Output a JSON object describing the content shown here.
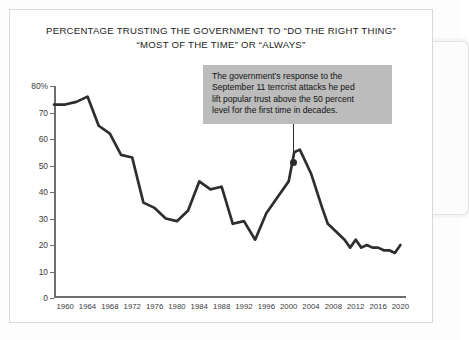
{
  "title": {
    "line1": "PERCENTAGE TRUSTING THE GOVERNMENT TO “DO THE RIGHT THING”",
    "line2": "“MOST OF THE TIME” OR “ALWAYS”"
  },
  "annotation": {
    "line1": "The government’s response to the",
    "line2": "September 11 terrcrist attacks he ped",
    "line3": "lift popular trust above the 50 percent",
    "line4": "level for the first time in decades."
  },
  "colors": {
    "line": "#2e2e2e",
    "axis": "#6e6e6e",
    "callout_bg": "#bcbcbc",
    "card_border": "#d8d8d8",
    "text": "#1d1d1d"
  },
  "chart_data": {
    "type": "line",
    "title": "PERCENTAGE TRUSTING THE GOVERNMENT TO “DO THE RIGHT THING” “MOST OF THE TIME” OR “ALWAYS”",
    "xlabel": "",
    "ylabel": "",
    "xlim": [
      1958,
      2021
    ],
    "ylim": [
      0,
      80
    ],
    "grid": false,
    "legend": "none",
    "ytick_labels": [
      "80%",
      "70",
      "60",
      "50",
      "40",
      "30",
      "20",
      "10",
      "0"
    ],
    "ytick_values": [
      80,
      70,
      60,
      50,
      40,
      30,
      20,
      10,
      0
    ],
    "xtick_labels": [
      "1960",
      "1964",
      "1968",
      "1972",
      "1976",
      "1980",
      "1984",
      "1988",
      "1992",
      "1996",
      "2000",
      "2004",
      "2008",
      "2012",
      "2016",
      "2020"
    ],
    "xtick_values": [
      1960,
      1964,
      1968,
      1972,
      1976,
      1980,
      1984,
      1988,
      1992,
      1996,
      2000,
      2004,
      2008,
      2012,
      2016,
      2020
    ],
    "series": [
      {
        "name": "Trust in government",
        "x": [
          1958,
          1960,
          1962,
          1964,
          1966,
          1968,
          1970,
          1972,
          1974,
          1976,
          1978,
          1980,
          1982,
          1984,
          1986,
          1988,
          1990,
          1992,
          1994,
          1996,
          1998,
          2000,
          2001,
          2002,
          2004,
          2006,
          2007,
          2008,
          2010,
          2011,
          2012,
          2013,
          2014,
          2015,
          2016,
          2017,
          2018,
          2019,
          2020
        ],
        "y": [
          73,
          73,
          74,
          76,
          65,
          62,
          54,
          53,
          36,
          34,
          30,
          29,
          33,
          44,
          41,
          42,
          28,
          29,
          22,
          32,
          38,
          44,
          55,
          56,
          47,
          34,
          28,
          26,
          22,
          19,
          22,
          19,
          20,
          19,
          19,
          18,
          18,
          17,
          20
        ]
      }
    ],
    "annotations": [
      {
        "text": "The government’s response to the September 11 terrcrist attacks he ped lift popular trust above the 50 percent level for the first time in decades.",
        "points_to_x": 2002,
        "points_to_y": 56
      }
    ]
  }
}
